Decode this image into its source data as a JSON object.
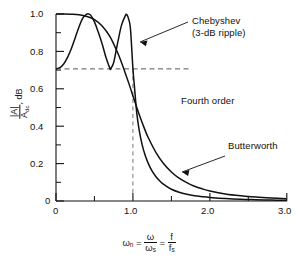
{
  "chart_data": {
    "type": "line",
    "title": "",
    "subtitle": "",
    "xlabel": "ωn = ω/ωs = f/fs",
    "ylabel": "|A| / Adc , dB",
    "xlim": [
      0,
      3.0
    ],
    "ylim": [
      0,
      1.0
    ],
    "grid": false,
    "legend_position": "inline-annotations",
    "xticks": [
      0,
      1.0,
      2.0,
      3.0
    ],
    "xtick_labels": [
      "0",
      "1.0",
      "2.0",
      "3.0"
    ],
    "xminor_ticks": [
      0.5,
      1.5,
      2.5
    ],
    "yticks": [
      0,
      0.2,
      0.4,
      0.6,
      0.8,
      1.0
    ],
    "ytick_labels": [
      "0",
      "0.2",
      "0.4",
      "0.6",
      "0.8",
      "1.0"
    ],
    "yminor_ticks": [
      0.1,
      0.3,
      0.5,
      0.7,
      0.9
    ],
    "reference_lines": [
      {
        "name": "cutoff-level",
        "orientation": "horizontal",
        "value": 0.707,
        "style": "dashed"
      },
      {
        "name": "cutoff-frequency",
        "orientation": "vertical",
        "value": 1.0,
        "style": "dashed"
      }
    ],
    "annotations": [
      {
        "name": "chebyshev-label",
        "text_line1": "Chebyshev",
        "text_line2": "(3-dB ripple)",
        "points_to_x": 1.0,
        "points_to_y": 0.86
      },
      {
        "name": "order-label",
        "text": "Fourth order"
      },
      {
        "name": "butterworth-label",
        "text": "Butterworth",
        "points_to_x": 1.55,
        "points_to_y": 0.16
      }
    ],
    "series": [
      {
        "name": "Chebyshev",
        "label": "Chebyshev (3-dB ripple)",
        "color": "#111111",
        "x": [
          0.0,
          0.05,
          0.1,
          0.15,
          0.2,
          0.25,
          0.3,
          0.35,
          0.4,
          0.42,
          0.45,
          0.5,
          0.55,
          0.6,
          0.65,
          0.7,
          0.71,
          0.75,
          0.8,
          0.85,
          0.9,
          0.92,
          0.95,
          0.97,
          1.0,
          1.02,
          1.05,
          1.08,
          1.12,
          1.16,
          1.2,
          1.25,
          1.3,
          1.35,
          1.4,
          1.5,
          1.6,
          1.7,
          1.8,
          1.9,
          2.0,
          2.2,
          2.4,
          2.6,
          2.8,
          3.0
        ],
        "y": [
          0.707,
          0.713,
          0.733,
          0.768,
          0.816,
          0.873,
          0.932,
          0.979,
          0.999,
          1.0,
          0.994,
          0.958,
          0.902,
          0.84,
          0.767,
          0.71,
          0.707,
          0.741,
          0.843,
          0.938,
          0.99,
          0.997,
          0.965,
          0.91,
          0.707,
          0.61,
          0.47,
          0.382,
          0.3,
          0.243,
          0.2,
          0.16,
          0.13,
          0.107,
          0.089,
          0.063,
          0.047,
          0.036,
          0.028,
          0.023,
          0.019,
          0.013,
          0.009,
          0.007,
          0.005,
          0.004
        ]
      },
      {
        "name": "Butterworth",
        "label": "Butterworth",
        "color": "#111111",
        "x": [
          0.0,
          0.1,
          0.2,
          0.3,
          0.4,
          0.5,
          0.6,
          0.7,
          0.8,
          0.85,
          0.9,
          0.95,
          1.0,
          1.05,
          1.1,
          1.15,
          1.2,
          1.3,
          1.4,
          1.5,
          1.6,
          1.7,
          1.8,
          1.9,
          2.0,
          2.2,
          2.4,
          2.6,
          2.8,
          3.0
        ],
        "y": [
          1.0,
          1.0,
          0.999,
          0.996,
          0.987,
          0.97,
          0.936,
          0.88,
          0.794,
          0.742,
          0.685,
          0.625,
          0.562,
          0.5,
          0.441,
          0.387,
          0.338,
          0.259,
          0.199,
          0.155,
          0.122,
          0.098,
          0.079,
          0.065,
          0.054,
          0.038,
          0.028,
          0.021,
          0.016,
          0.012
        ]
      }
    ]
  },
  "axes": {
    "y_label_numerator": "|A|",
    "y_label_denominator": "A",
    "y_label_denominator_sub": "dc",
    "y_label_suffix": ", dB",
    "x_label_omega": "ω",
    "x_label_omega_sub": "n",
    "x_label_eq1": "=",
    "x_label_num1": "ω",
    "x_label_den1": "ω",
    "x_label_den1_sub": "s",
    "x_label_eq2": "=",
    "x_label_num2": "f",
    "x_label_den2": "f",
    "x_label_den2_sub": "s"
  },
  "labels": {
    "chebyshev_line1": "Chebyshev",
    "chebyshev_line2": "(3-dB ripple)",
    "fourth_order": "Fourth order",
    "butterworth": "Butterworth"
  },
  "xticks": {
    "t0": "0",
    "t1": "1.0",
    "t2": "2.0",
    "t3": "3.0"
  },
  "yticks": {
    "t0": "0",
    "t1": "0.2",
    "t2": "0.4",
    "t3": "0.6",
    "t4": "0.8",
    "t5": "1.0"
  }
}
